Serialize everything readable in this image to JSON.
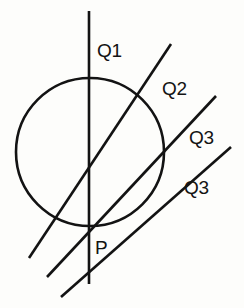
{
  "figure": {
    "background_color": "#fdfdfb",
    "stroke_color": "#131313",
    "labels": {
      "q1": "Q1",
      "q2": "Q2",
      "q3_upper": "Q3",
      "q3_lower": "Q3",
      "p": "P"
    }
  },
  "chart_data": {
    "type": "diagram",
    "coordinate_space": {
      "width": 244,
      "height": 308,
      "origin": "top-left"
    },
    "point_P": {
      "x": 89,
      "y": 226,
      "label": "P"
    },
    "circle": {
      "cx": 90,
      "cy": 152,
      "r": 74,
      "stroke_width": 2.6,
      "fill": "none"
    },
    "lines": [
      {
        "label": "Q1",
        "role": "vertical-diameter-line",
        "x1": 89,
        "y1": 11,
        "x2": 89,
        "y2": 284,
        "stroke_width": 2.6,
        "label_position": {
          "x": 97,
          "y": 41
        },
        "passes_through_P": true,
        "circle_intersections": [
          {
            "x": 89,
            "y": 78
          },
          {
            "x": 89,
            "y": 226
          }
        ]
      },
      {
        "label": "Q2",
        "role": "secant-line",
        "x1": 171,
        "y1": 44,
        "x2": 29,
        "y2": 258,
        "stroke_width": 2.6,
        "label_position": {
          "x": 162,
          "y": 79
        },
        "passes_through_P": true,
        "circle_intersections": [
          {
            "x": 141,
            "y": 107
          },
          {
            "x": 89,
            "y": 226
          }
        ]
      },
      {
        "label": "Q3",
        "role": "secant-line",
        "x1": 216,
        "y1": 96,
        "x2": 47,
        "y2": 277,
        "stroke_width": 2.6,
        "label_position": {
          "x": 189,
          "y": 128
        },
        "passes_through_P": true,
        "circle_intersections": [
          {
            "x": 156,
            "y": 160
          },
          {
            "x": 89,
            "y": 226
          }
        ]
      },
      {
        "label": "Q3",
        "role": "secant-line",
        "x1": 231,
        "y1": 147,
        "x2": 61,
        "y2": 297,
        "stroke_width": 2.6,
        "label_position": {
          "x": 184,
          "y": 178
        },
        "passes_through_P": true,
        "circle_intersections": [
          {
            "x": 148,
            "y": 194
          },
          {
            "x": 89,
            "y": 226
          }
        ]
      }
    ],
    "annotations": [
      {
        "text": "Q1",
        "x": 97,
        "y": 41
      },
      {
        "text": "Q2",
        "x": 162,
        "y": 79
      },
      {
        "text": "Q3",
        "x": 189,
        "y": 128
      },
      {
        "text": "Q3",
        "x": 184,
        "y": 178
      },
      {
        "text": "P",
        "x": 95,
        "y": 238
      }
    ],
    "grid": false,
    "legend": null,
    "xlabel": "",
    "ylabel": ""
  }
}
